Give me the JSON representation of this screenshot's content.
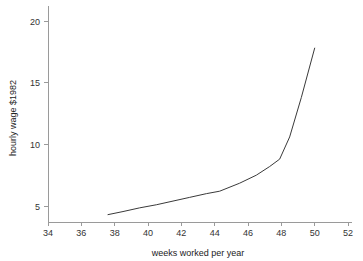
{
  "chart_data": {
    "type": "line",
    "title": "",
    "xlabel": "weeks worked per year",
    "ylabel": "hourly wage $1982",
    "xlim": [
      33,
      52.6
    ],
    "ylim": [
      3.2,
      21.2
    ],
    "xticks": [
      34,
      36,
      38,
      40,
      42,
      44,
      46,
      48,
      50,
      52
    ],
    "yticks": [
      5,
      10,
      15,
      20
    ],
    "xtick_labels": [
      "34",
      "36",
      "38",
      "40",
      "42",
      "44",
      "46",
      "48",
      "50",
      "52"
    ],
    "ytick_labels": [
      "5",
      "10",
      "15",
      "20"
    ],
    "grid": false,
    "legend": false,
    "line_color": "#3a3a3a",
    "axis_color": "#9a9a9a",
    "background": "#ffffff",
    "series": [
      {
        "name": "hourly wage",
        "x": [
          37.6,
          38.5,
          39.5,
          40.5,
          41.5,
          42.5,
          43.5,
          44.3,
          45.5,
          46.5,
          47.3,
          47.9,
          48.5,
          49.2,
          50.0
        ],
        "y": [
          4.3,
          4.55,
          4.85,
          5.1,
          5.4,
          5.7,
          6.0,
          6.2,
          6.85,
          7.5,
          8.2,
          8.8,
          10.6,
          13.8,
          17.8
        ]
      }
    ]
  },
  "axis_labels": {
    "x_title": "weeks worked per year",
    "y_title": "hourly wage $1982"
  }
}
